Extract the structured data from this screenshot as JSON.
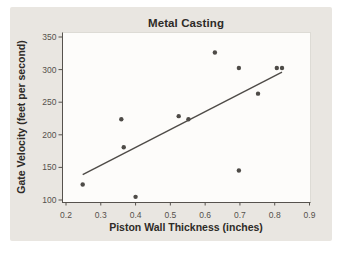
{
  "title": "Metal Casting",
  "colors": {
    "page_bg": "#ffffff",
    "card_bg": "#e9e6e1",
    "plot_bg": "#fdfcfa",
    "axis": "#56524d",
    "tick_label": "#55514c",
    "text": "#2e2b27",
    "point": "#4e4b47",
    "trend_line": "#4e4b47"
  },
  "chart_data": {
    "type": "scatter",
    "title": "Metal Casting",
    "xlabel": "Piston Wall Thickness (inches)",
    "ylabel": "Gate Velocity (feet per second)",
    "xlim": [
      0.2,
      0.9
    ],
    "ylim": [
      100,
      350
    ],
    "xticks": [
      0.2,
      0.3,
      0.4,
      0.5,
      0.6,
      0.7,
      0.8,
      0.9
    ],
    "yticks": [
      100,
      150,
      200,
      250,
      300,
      350
    ],
    "grid": false,
    "legend": false,
    "points": [
      {
        "x": 0.248,
        "y": 123.8
      },
      {
        "x": 0.359,
        "y": 223.9
      },
      {
        "x": 0.366,
        "y": 180.9
      },
      {
        "x": 0.4,
        "y": 104.8
      },
      {
        "x": 0.524,
        "y": 228.6
      },
      {
        "x": 0.552,
        "y": 223.8
      },
      {
        "x": 0.628,
        "y": 326.2
      },
      {
        "x": 0.697,
        "y": 302.4
      },
      {
        "x": 0.697,
        "y": 145.2
      },
      {
        "x": 0.752,
        "y": 263.1
      },
      {
        "x": 0.806,
        "y": 302.4
      },
      {
        "x": 0.821,
        "y": 302.4
      }
    ],
    "trend_line": {
      "x1": 0.248,
      "y1": 138.9,
      "x2": 0.821,
      "y2": 296.2
    }
  }
}
